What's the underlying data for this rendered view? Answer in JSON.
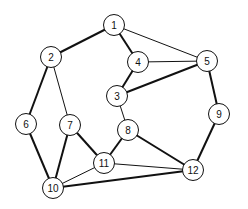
{
  "graph": {
    "nodes": [
      {
        "id": "1",
        "x": 114,
        "y": 25
      },
      {
        "id": "2",
        "x": 51,
        "y": 57
      },
      {
        "id": "3",
        "x": 117,
        "y": 96
      },
      {
        "id": "4",
        "x": 138,
        "y": 62
      },
      {
        "id": "5",
        "x": 207,
        "y": 61
      },
      {
        "id": "6",
        "x": 26,
        "y": 124
      },
      {
        "id": "7",
        "x": 70,
        "y": 125
      },
      {
        "id": "8",
        "x": 128,
        "y": 130
      },
      {
        "id": "9",
        "x": 219,
        "y": 114
      },
      {
        "id": "10",
        "x": 53,
        "y": 188
      },
      {
        "id": "11",
        "x": 104,
        "y": 163
      },
      {
        "id": "12",
        "x": 193,
        "y": 170
      }
    ],
    "edges": [
      {
        "from": "1",
        "to": "2",
        "weight": "thick"
      },
      {
        "from": "1",
        "to": "4",
        "weight": "thick"
      },
      {
        "from": "1",
        "to": "5",
        "weight": "thin"
      },
      {
        "from": "2",
        "to": "6",
        "weight": "thick"
      },
      {
        "from": "2",
        "to": "7",
        "weight": "thin"
      },
      {
        "from": "4",
        "to": "5",
        "weight": "thin"
      },
      {
        "from": "4",
        "to": "3",
        "weight": "thick"
      },
      {
        "from": "3",
        "to": "5",
        "weight": "thick"
      },
      {
        "from": "5",
        "to": "9",
        "weight": "thick"
      },
      {
        "from": "3",
        "to": "8",
        "weight": "thin"
      },
      {
        "from": "6",
        "to": "10",
        "weight": "thick"
      },
      {
        "from": "7",
        "to": "10",
        "weight": "thick"
      },
      {
        "from": "7",
        "to": "11",
        "weight": "thick"
      },
      {
        "from": "8",
        "to": "11",
        "weight": "thick"
      },
      {
        "from": "8",
        "to": "12",
        "weight": "thick"
      },
      {
        "from": "9",
        "to": "12",
        "weight": "thick"
      },
      {
        "from": "11",
        "to": "12",
        "weight": "thin"
      },
      {
        "from": "10",
        "to": "11",
        "weight": "thin"
      },
      {
        "from": "10",
        "to": "12",
        "weight": "thick"
      }
    ]
  }
}
